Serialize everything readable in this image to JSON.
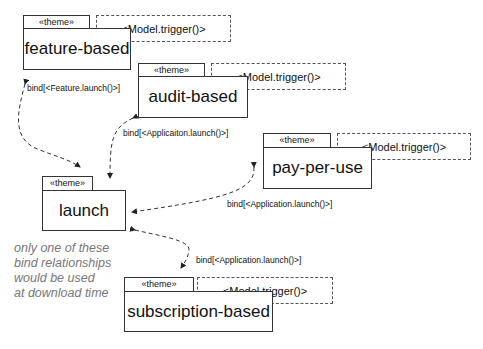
{
  "diagram": {
    "themes": [
      {
        "id": "feature-based",
        "stereotype": "«theme»",
        "name": "feature-based",
        "trigger": "<Model.trigger()>"
      },
      {
        "id": "audit-based",
        "stereotype": "«theme»",
        "name": "audit-based",
        "trigger": "<Model.trigger()>"
      },
      {
        "id": "pay-per-use",
        "stereotype": "«theme»",
        "name": "pay-per-use",
        "trigger": "<Model.trigger()>"
      },
      {
        "id": "launch",
        "stereotype": "«theme»",
        "name": "launch"
      },
      {
        "id": "subscription-based",
        "stereotype": "«theme»",
        "name": "subscription-based",
        "trigger": "<Model.trigger()>"
      }
    ],
    "binds": [
      {
        "from": "feature-based",
        "to": "launch",
        "label": "bind[<Feature.launch()>]"
      },
      {
        "from": "audit-based",
        "to": "launch",
        "label": "bind[<Applicaiton.launch()>]"
      },
      {
        "from": "pay-per-use",
        "to": "launch",
        "label": "bind[<Application.launch()>]"
      },
      {
        "from": "subscription-based",
        "to": "launch",
        "label": "bind[<Application.launch()>]"
      }
    ],
    "note": {
      "lines": [
        "only one of these",
        "bind relationships",
        "would be used",
        "at download time"
      ]
    }
  }
}
